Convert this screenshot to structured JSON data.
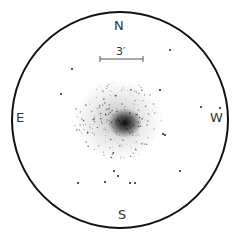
{
  "labels": {
    "north": "N",
    "south": "S",
    "east": "E",
    "west": "W"
  },
  "scale": {
    "text": "3′"
  },
  "colors": {
    "circle": "#111111",
    "stars": "#1a1a1a",
    "scale_bar": "#555555"
  }
}
